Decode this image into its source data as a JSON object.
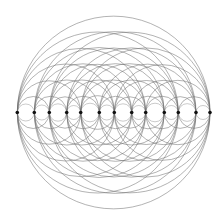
{
  "diagram": {
    "type": "circle-arc-pattern",
    "baseline_y": 112.5,
    "points_x": [
      17.3,
      34.3,
      49.3,
      66.7,
      80.7,
      99.3,
      114.3,
      131.7,
      145.7,
      164.3,
      178.3,
      196,
      210
    ],
    "spans": [
      2,
      4,
      6,
      8,
      10,
      12
    ],
    "colors": {
      "background": "#ffffff",
      "stroke": "#6e6e6e",
      "point": "#111111"
    }
  }
}
